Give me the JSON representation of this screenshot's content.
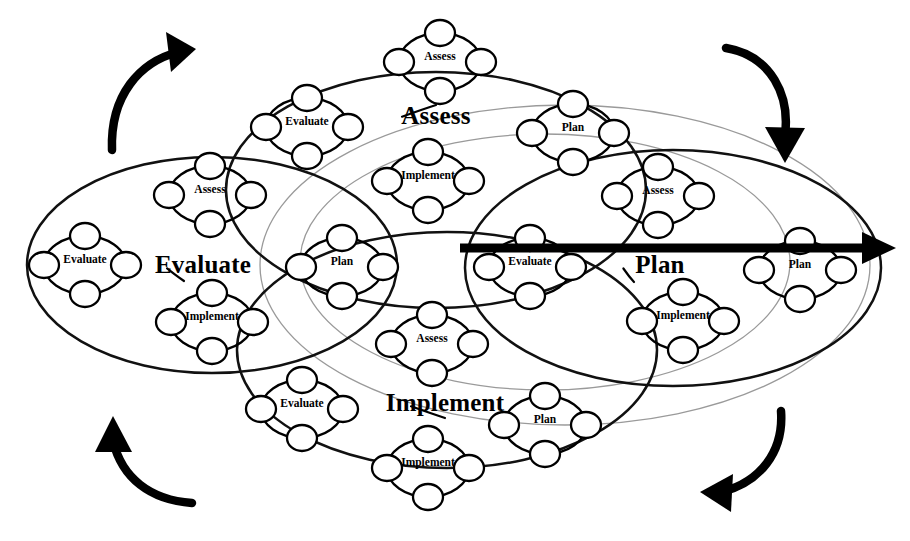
{
  "diagram": {
    "colors": {
      "stroke": "#000000",
      "outer_guide": "#9a9a9a",
      "background": "#ffffff"
    },
    "phase_names": [
      "Assess",
      "Plan",
      "Implement",
      "Evaluate"
    ],
    "rotation_direction": "clockwise"
  },
  "major_cycles": [
    {
      "id": "assess",
      "label": "Assess",
      "position": "top",
      "cx": 436,
      "cy": 190,
      "rx": 210,
      "ry": 118,
      "label_x": 436,
      "label_y": 118,
      "tick_from_x": 436,
      "tick_from_y": 105,
      "units": [
        {
          "label": "Assess",
          "cx": 440,
          "cy": 62,
          "slot": "top"
        },
        {
          "label": "Plan",
          "cx": 573,
          "cy": 133,
          "slot": "right"
        },
        {
          "label": "Implement",
          "cx": 428,
          "cy": 181,
          "slot": "bottom"
        },
        {
          "label": "Evaluate",
          "cx": 307,
          "cy": 127,
          "slot": "left"
        }
      ]
    },
    {
      "id": "plan",
      "label": "Plan",
      "position": "right",
      "cx": 673,
      "cy": 268,
      "rx": 208,
      "ry": 118,
      "label_x": 660,
      "label_y": 267,
      "tick_from_x": 634,
      "tick_from_y": 282,
      "units": [
        {
          "label": "Assess",
          "cx": 658,
          "cy": 196,
          "slot": "top"
        },
        {
          "label": "Plan",
          "cx": 800,
          "cy": 270,
          "slot": "right"
        },
        {
          "label": "Implement",
          "cx": 683,
          "cy": 321,
          "slot": "bottom"
        },
        {
          "label": "Evaluate",
          "cx": 530,
          "cy": 267,
          "slot": "left"
        }
      ]
    },
    {
      "id": "implement",
      "label": "Implement",
      "position": "bottom",
      "cx": 447,
      "cy": 350,
      "rx": 210,
      "ry": 118,
      "label_x": 445,
      "label_y": 405,
      "tick_from_x": 445,
      "tick_from_y": 418,
      "units": [
        {
          "label": "Assess",
          "cx": 432,
          "cy": 344,
          "slot": "top"
        },
        {
          "label": "Plan",
          "cx": 545,
          "cy": 425,
          "slot": "right"
        },
        {
          "label": "Implement",
          "cx": 428,
          "cy": 468,
          "slot": "bottom"
        },
        {
          "label": "Evaluate",
          "cx": 302,
          "cy": 409,
          "slot": "left"
        }
      ]
    },
    {
      "id": "evaluate",
      "label": "Evaluate",
      "position": "left",
      "cx": 212,
      "cy": 265,
      "rx": 185,
      "ry": 108,
      "label_x": 203,
      "label_y": 267,
      "tick_from_x": 184,
      "tick_from_y": 281,
      "units": [
        {
          "label": "Assess",
          "cx": 210,
          "cy": 195,
          "slot": "top"
        },
        {
          "label": "Plan",
          "cx": 342,
          "cy": 267,
          "slot": "right"
        },
        {
          "label": "Implement",
          "cx": 212,
          "cy": 322,
          "slot": "bottom"
        },
        {
          "label": "Evaluate",
          "cx": 85,
          "cy": 265,
          "slot": "left"
        }
      ]
    }
  ],
  "outer_guides": [
    {
      "cx": 565,
      "cy": 265,
      "rx": 305,
      "ry": 160
    },
    {
      "cx": 545,
      "cy": 262,
      "rx": 245,
      "ry": 128
    }
  ],
  "axis_arrow": {
    "name": "plan-axis-arrow",
    "x1": 460,
    "y1": 248,
    "x2": 866,
    "y2": 248,
    "head_points": "862,232 896,248 862,264"
  },
  "corner_arrows": [
    {
      "id": "top-left",
      "direction": "up-right",
      "path": "M 112 150 C 110 95 140 62 178 52",
      "head": "166,32 196,49 171,72"
    },
    {
      "id": "top-right",
      "direction": "down",
      "path": "M 726 48 C 772 56 790 96 785 135",
      "head": "765,127 785,163 805,128"
    },
    {
      "id": "bottom-right",
      "direction": "down-left",
      "path": "M 781 411 C 784 452 760 482 722 492",
      "head": "733,474 700,492 731,512"
    },
    {
      "id": "bottom-left",
      "direction": "up",
      "path": "M 192 503 C 150 500 122 478 113 441",
      "head": "95,452 113,416 132,452"
    }
  ],
  "unit_geometry": {
    "rx": 41,
    "ry": 29,
    "node_rx": 15,
    "node_ry": 13,
    "label_dy": -5
  }
}
